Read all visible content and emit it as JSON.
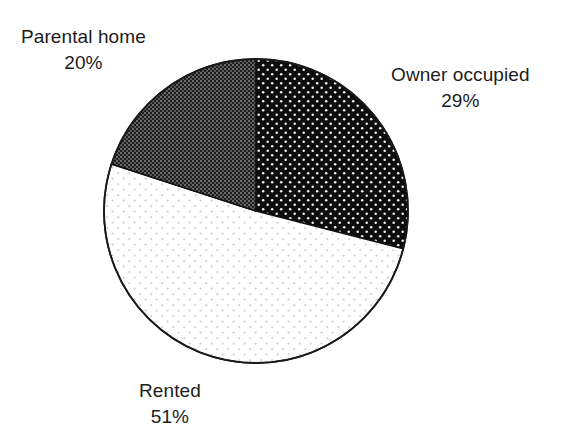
{
  "chart_data": {
    "type": "pie",
    "title": "",
    "subtitle": "",
    "xlabel": "",
    "ylabel": "",
    "legend_position": "none",
    "grid": false,
    "value_unit": "%",
    "start_angle_deg": 0,
    "direction": "clockwise",
    "categories": [
      "Owner occupied",
      "Rented",
      "Parental home"
    ],
    "values": [
      29,
      51,
      20
    ],
    "labels": [
      "29%",
      "51%",
      "20%"
    ],
    "slices": [
      {
        "name": "Owner occupied",
        "value": 29,
        "value_label": "29%",
        "fill_style": "black-with-white-dot-grid",
        "base_color": "#0d0d0d",
        "accent_color": "#ffffff",
        "start_angle_deg": 0,
        "end_angle_deg": 104.4
      },
      {
        "name": "Rented",
        "value": 51,
        "value_label": "51%",
        "fill_style": "white-with-sparse-faint-dots",
        "base_color": "#ffffff",
        "accent_color": "#c9c9c9",
        "start_angle_deg": 104.4,
        "end_angle_deg": 288.0
      },
      {
        "name": "Parental home",
        "value": 20,
        "value_label": "20%",
        "fill_style": "dark-gray-fine-crosshatch",
        "base_color": "#2b2b2b",
        "accent_color": "#6e6e6e",
        "start_angle_deg": 288.0,
        "end_angle_deg": 360.0
      }
    ]
  },
  "pie": {
    "center_x": 256,
    "center_y": 211,
    "radius": 152,
    "outline_color": "#1a1a1a"
  },
  "labels": {
    "parental_home": {
      "name": "Parental home",
      "percent": "20%"
    },
    "owner_occupied": {
      "name": "Owner occupied",
      "percent": "29%"
    },
    "rented": {
      "name": "Rented",
      "percent": "51%"
    }
  },
  "colors": {
    "background": "#ffffff",
    "text": "#1c1c1c",
    "outline": "#1a1a1a"
  }
}
